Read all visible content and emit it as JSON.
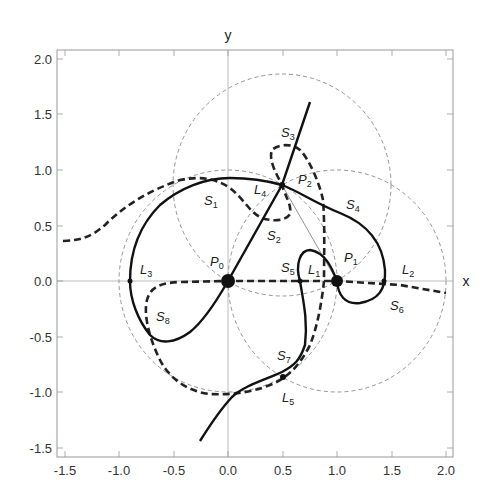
{
  "figure": {
    "x_axis_name": "x",
    "y_axis_name": "y",
    "x_ticks": [
      "-1.5",
      "-1.0",
      "-0.5",
      "0.0",
      "0.5",
      "1.0",
      "1.5",
      "2.0"
    ],
    "y_ticks": [
      "2.0",
      "1.5",
      "1.0",
      "0.5",
      "0.0",
      "-0.5",
      "-1.0",
      "-1.5"
    ],
    "xlim": [
      -1.55,
      2.08
    ],
    "ylim": [
      -1.58,
      2.07
    ]
  },
  "primaries": [
    {
      "name": "P",
      "sub": "0",
      "x": 0.0,
      "y": 0.0
    },
    {
      "name": "P",
      "sub": "1",
      "x": 1.0,
      "y": 0.0
    },
    {
      "name": "P",
      "sub": "2",
      "x": 0.5,
      "y": 0.866
    }
  ],
  "lagrange_points": [
    {
      "name": "L",
      "sub": "1",
      "x": 0.66,
      "y": 0.0
    },
    {
      "name": "L",
      "sub": "2",
      "x": 1.42,
      "y": 0.0
    },
    {
      "name": "L",
      "sub": "3",
      "x": -0.93,
      "y": 0.0
    },
    {
      "name": "L",
      "sub": "4",
      "x": 0.5,
      "y": 0.866
    },
    {
      "name": "L",
      "sub": "5",
      "x": 0.5,
      "y": -0.866
    }
  ],
  "curve_labels": [
    {
      "name": "S",
      "sub": "1"
    },
    {
      "name": "S",
      "sub": "2"
    },
    {
      "name": "S",
      "sub": "3"
    },
    {
      "name": "S",
      "sub": "4"
    },
    {
      "name": "S",
      "sub": "5"
    },
    {
      "name": "S",
      "sub": "6"
    },
    {
      "name": "S",
      "sub": "7"
    },
    {
      "name": "S",
      "sub": "8"
    }
  ],
  "legend_notes": {
    "solid": "solid thick curve",
    "dashed": "dashed thick curve",
    "circles": "thin dashed unit circles around P0, P1, P2"
  }
}
